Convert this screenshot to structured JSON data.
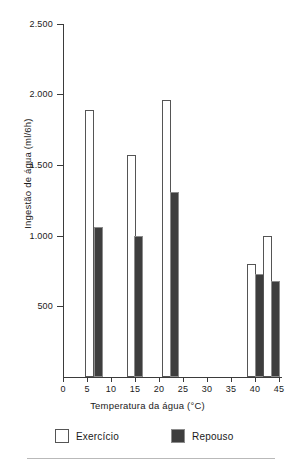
{
  "chart_data": {
    "type": "bar",
    "title": "",
    "subtitle": "",
    "xlabel": "Temperatura da água (°C)",
    "ylabel": "Ingestão de água (ml/6h)",
    "xlim": [
      0,
      45
    ],
    "ylim": [
      0,
      2500
    ],
    "grid": false,
    "legend_position": "bottom",
    "x_ticks": [
      0,
      5,
      10,
      15,
      20,
      25,
      30,
      35,
      40,
      45
    ],
    "x_tick_labels": [
      "0",
      "5",
      "10",
      "15",
      "20",
      "25",
      "30",
      "35",
      "40",
      "45"
    ],
    "y_ticks": [
      500,
      1000,
      1500,
      2000,
      2500
    ],
    "y_tick_labels": [
      "500",
      "1.000",
      "1.500",
      "2.000",
      "2.500"
    ],
    "categories": [
      6,
      15,
      22.5,
      40,
      43.5
    ],
    "category_labels": [
      "6",
      "15",
      "22,5",
      "40",
      "43,5"
    ],
    "series": [
      {
        "name": "Exercício",
        "color": "#ffffff",
        "edge_color": "#555555",
        "values": [
          1890,
          1570,
          1960,
          800,
          1000
        ]
      },
      {
        "name": "Repouso",
        "color": "#3e3e3e",
        "edge_color": "#8c8c8c",
        "values": [
          1060,
          1000,
          1310,
          730,
          680
        ]
      }
    ],
    "bars": [
      {
        "series": "Exercício",
        "x": 5.6,
        "value": 1890
      },
      {
        "series": "Repouso",
        "x": 7.3,
        "value": 1060
      },
      {
        "series": "Exercício",
        "x": 14.2,
        "value": 1570
      },
      {
        "series": "Repouso",
        "x": 15.8,
        "value": 1000
      },
      {
        "series": "Exercício",
        "x": 21.5,
        "value": 1960
      },
      {
        "series": "Repouso",
        "x": 23.2,
        "value": 1310
      },
      {
        "series": "Exercício",
        "x": 39.3,
        "value": 800
      },
      {
        "series": "Repouso",
        "x": 40.9,
        "value": 730
      },
      {
        "series": "Exercício",
        "x": 42.6,
        "value": 1000
      },
      {
        "series": "Repouso",
        "x": 44.2,
        "value": 680
      }
    ]
  },
  "legend": {
    "entries": [
      {
        "label": "Exercício",
        "swatch": "white-square"
      },
      {
        "label": "Repouso",
        "swatch": "dark-square"
      }
    ]
  },
  "axes": {
    "y_title": "Ingestão de água (ml/6h)",
    "x_title": "Temperatura da água (°C)"
  }
}
